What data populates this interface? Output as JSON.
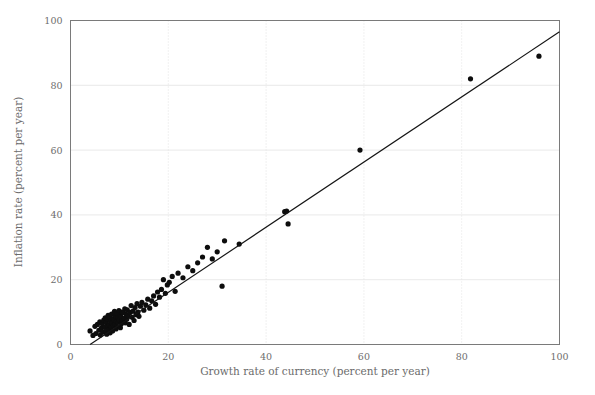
{
  "figure": {
    "title": "",
    "background_color": "#ffffff",
    "width": 595,
    "height": 395
  },
  "axis_titles": {
    "x": "Growth rate of currency (percent per year)",
    "y": "Inflation rate (percent per year)"
  },
  "colors": {
    "point": "#0d0d0d",
    "line": "#141414",
    "frame": "#7a7a7a",
    "grid": "#e3e3e3",
    "tick_text": "#6e6e6e",
    "axis_title_text": "#6b6b6b",
    "background": "#ffffff"
  },
  "x_ticks": [
    "0",
    "20",
    "40",
    "60",
    "80",
    "100"
  ],
  "y_ticks": [
    "0",
    "20",
    "40",
    "60",
    "80",
    "100"
  ],
  "chart_data": {
    "type": "scatter",
    "title": "",
    "subtitle": "",
    "xlabel": "Growth rate of currency (percent per year)",
    "ylabel": "Inflation rate (percent per year)",
    "xlim": [
      0,
      100
    ],
    "ylim": [
      0,
      100
    ],
    "xticks": [
      0,
      20,
      40,
      60,
      80,
      100
    ],
    "yticks": [
      0,
      20,
      40,
      60,
      80,
      100
    ],
    "grid": true,
    "legend": false,
    "legend_position": "none",
    "marker": "circle",
    "marker_size": 2.6,
    "series": [
      {
        "name": "Countries",
        "x": [
          4.0,
          4.6,
          5.0,
          5.2,
          5.5,
          5.8,
          6.0,
          6.1,
          6.3,
          6.5,
          6.6,
          6.8,
          7.0,
          7.1,
          7.2,
          7.3,
          7.4,
          7.5,
          7.6,
          7.7,
          7.8,
          7.9,
          8.0,
          8.1,
          8.2,
          8.3,
          8.4,
          8.5,
          8.6,
          8.7,
          8.8,
          8.9,
          9.0,
          9.1,
          9.2,
          9.3,
          9.4,
          9.5,
          9.6,
          9.7,
          9.8,
          9.9,
          10.0,
          10.1,
          10.2,
          10.3,
          10.4,
          10.5,
          10.6,
          10.8,
          11.0,
          11.1,
          11.2,
          11.4,
          11.5,
          11.6,
          11.8,
          12.0,
          12.2,
          12.4,
          12.6,
          12.8,
          13.0,
          13.2,
          13.4,
          13.6,
          13.8,
          14.0,
          14.3,
          14.6,
          15.0,
          15.4,
          15.8,
          16.2,
          16.6,
          17.0,
          17.4,
          17.8,
          18.2,
          18.6,
          19.0,
          19.4,
          19.8,
          20.2,
          20.8,
          21.4,
          22.0,
          23.0,
          24.0,
          25.0,
          26.0,
          27.0,
          28.0,
          29.0,
          30.0,
          31.0,
          31.5,
          34.5,
          43.8,
          44.2,
          44.5,
          59.2,
          81.8,
          95.8
        ],
        "y": [
          4.2,
          2.8,
          5.6,
          3.4,
          6.2,
          4.4,
          7.0,
          2.9,
          5.1,
          6.4,
          3.8,
          7.5,
          5.3,
          8.2,
          4.0,
          6.8,
          3.2,
          7.9,
          5.7,
          9.0,
          4.6,
          6.1,
          8.4,
          3.6,
          7.2,
          5.4,
          9.4,
          6.6,
          4.2,
          8.0,
          5.9,
          7.7,
          10.2,
          6.3,
          8.8,
          4.8,
          7.1,
          9.6,
          5.5,
          8.3,
          6.9,
          10.5,
          7.6,
          9.1,
          5.2,
          8.6,
          6.4,
          10.0,
          7.3,
          9.8,
          8.1,
          11.0,
          6.7,
          9.3,
          7.8,
          10.7,
          8.9,
          6.2,
          9.9,
          12.0,
          8.4,
          10.3,
          7.4,
          11.4,
          9.2,
          12.6,
          10.0,
          8.7,
          11.8,
          13.0,
          10.6,
          12.2,
          14.0,
          11.2,
          13.5,
          15.0,
          12.4,
          16.2,
          14.6,
          17.0,
          20.0,
          15.8,
          18.4,
          19.2,
          21.0,
          16.4,
          22.0,
          20.6,
          24.0,
          22.8,
          25.2,
          27.0,
          30.0,
          26.4,
          28.6,
          18.0,
          32.0,
          31.0,
          41.0,
          41.2,
          37.2,
          60.0,
          82.0,
          89.0
        ]
      }
    ],
    "fit_line": {
      "type": "linear",
      "x_start": 4.0,
      "y_start": 0.0,
      "x_end": 100.0,
      "y_end": 96.5,
      "description": "regression line through scatter"
    }
  }
}
